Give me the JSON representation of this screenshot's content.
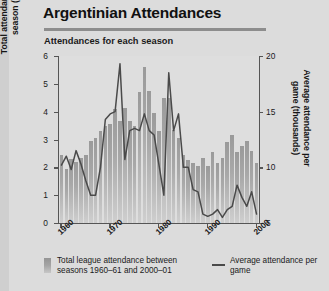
{
  "header": {
    "title": "Argentinian Attendances",
    "subtitle": "Attendances for each season"
  },
  "legend": {
    "bar_label": "Total league attendance between seasons 1960–61 and 2000–01",
    "line_label": "Average attendance per game"
  },
  "axes": {
    "left_title": "Total attendances for each season (millions)",
    "right_title": "Average attendance per game (thousands)",
    "left_ticks": [
      "0",
      "1",
      "2",
      "3",
      "4",
      "5",
      "6"
    ],
    "right_ticks": [
      "5",
      "10",
      "15",
      "20"
    ],
    "x_ticks": [
      "1960",
      "1970",
      "1980",
      "1990",
      "2000"
    ]
  },
  "chart_data": {
    "type": "bar",
    "title": "Argentinian Attendances",
    "subtitle": "Attendances for each season",
    "xlabel": "",
    "ylabel": "Total attendances for each season (millions)",
    "y2label": "Average attendance per game (thousands)",
    "ylim": [
      0,
      6
    ],
    "y2lim": [
      5,
      20
    ],
    "grid": false,
    "legend_position": "bottom",
    "categories": [
      "1960–61",
      "1961–62",
      "1962–63",
      "1963–64",
      "1964–65",
      "1965–66",
      "1966–67",
      "1967–68",
      "1968–69",
      "1969–70",
      "1970–71",
      "1971–72",
      "1972–73",
      "1973–74",
      "1974–75",
      "1975–76",
      "1976–77",
      "1977–78",
      "1978–79",
      "1979–80",
      "1980–81",
      "1981–82",
      "1982–83",
      "1983–84",
      "1984–85",
      "1985–86",
      "1986–87",
      "1987–88",
      "1988–89",
      "1989–90",
      "1990–91",
      "1991–92",
      "1992–93",
      "1993–94",
      "1994–95",
      "1995–96",
      "1996–97",
      "1997–98",
      "1998–99",
      "1999–00",
      "2000–01"
    ],
    "series": [
      {
        "name": "Total league attendance between seasons 1960–61 and 2000–01",
        "type": "bar",
        "axis": "left",
        "unit": "millions",
        "values": [
          2.45,
          1.95,
          2.3,
          2.2,
          2.35,
          2.45,
          2.95,
          3.05,
          3.3,
          3.5,
          3.55,
          4.1,
          3.65,
          4.15,
          3.65,
          3.5,
          4.7,
          5.6,
          4.75,
          3.95,
          3.3,
          4.5,
          4.5,
          3.35,
          3.05,
          2.45,
          2.25,
          2.15,
          2.05,
          2.35,
          2.05,
          2.55,
          2.15,
          2.35,
          2.9,
          3.15,
          2.55,
          2.75,
          2.95,
          2.6,
          2.15
        ]
      },
      {
        "name": "Average attendance per game",
        "type": "line",
        "axis": "right",
        "unit": "thousands",
        "values": [
          10.2,
          11.0,
          9.8,
          11.5,
          10.3,
          8.8,
          7.5,
          7.5,
          10.0,
          14.3,
          14.8,
          15.0,
          19.3,
          10.7,
          13.3,
          13.5,
          13.3,
          14.8,
          13.3,
          12.9,
          10.2,
          7.5,
          18.5,
          13.3,
          14.8,
          10.0,
          10.0,
          8.0,
          7.8,
          5.8,
          5.6,
          5.8,
          6.2,
          5.5,
          6.2,
          6.5,
          8.4,
          7.3,
          6.5,
          7.8,
          5.8
        ]
      }
    ]
  }
}
